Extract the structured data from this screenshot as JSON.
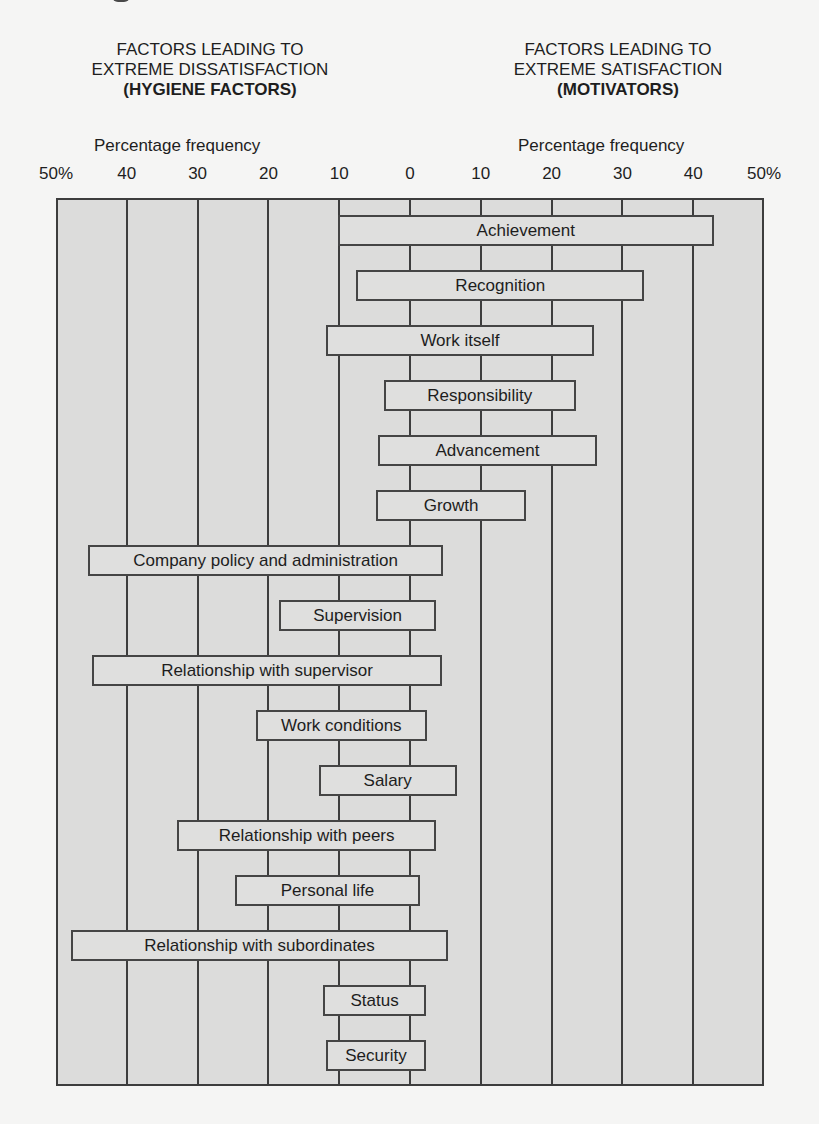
{
  "chart_data": {
    "type": "bar",
    "subtype": "diverging-horizontal-range",
    "left_heading": {
      "line1": "FACTORS LEADING TO",
      "line2": "EXTREME DISSATISFACTION",
      "line3": "(HYGIENE FACTORS)"
    },
    "right_heading": {
      "line1": "FACTORS LEADING TO",
      "line2": "EXTREME SATISFACTION",
      "line3": "(MOTIVATORS)"
    },
    "xlabel_left": "Percentage frequency",
    "xlabel_right": "Percentage frequency",
    "ticks": [
      {
        "value": -50,
        "label": "50%"
      },
      {
        "value": -40,
        "label": "40"
      },
      {
        "value": -30,
        "label": "30"
      },
      {
        "value": -20,
        "label": "20"
      },
      {
        "value": -10,
        "label": "10"
      },
      {
        "value": 0,
        "label": "0"
      },
      {
        "value": 10,
        "label": "10"
      },
      {
        "value": 20,
        "label": "20"
      },
      {
        "value": 30,
        "label": "30"
      },
      {
        "value": 40,
        "label": "40"
      },
      {
        "value": 50,
        "label": "50%"
      }
    ],
    "xlim": [
      -50,
      50
    ],
    "grid": true,
    "legend": "none",
    "note": "Bars span from dissatisfaction frequency (left of 0) to satisfaction frequency (right of 0). Values estimated from gridlines.",
    "categories": [
      "Achievement",
      "Recognition",
      "Work itself",
      "Responsibility",
      "Advancement",
      "Growth",
      "Company policy and administration",
      "Supervision",
      "Relationship with supervisor",
      "Work conditions",
      "Salary",
      "Relationship with peers",
      "Personal life",
      "Relationship with subordinates",
      "Status",
      "Security"
    ],
    "series": [
      {
        "name": "Dissatisfaction (left extent, %)",
        "values": [
          10,
          8,
          12,
          4,
          4.5,
          5,
          45.5,
          18.5,
          45,
          22,
          13,
          33,
          24.5,
          48,
          12,
          12
        ]
      },
      {
        "name": "Satisfaction (right extent, %)",
        "values": [
          43,
          33,
          26,
          23.5,
          26.5,
          16.5,
          4.5,
          3.5,
          4.5,
          2.5,
          6.5,
          3.5,
          1.5,
          5.5,
          2.5,
          2.5
        ]
      }
    ],
    "bars": [
      {
        "label": "Achievement",
        "left": -10.2,
        "right": 42.9,
        "group": "motivator"
      },
      {
        "label": "Recognition",
        "left": -7.6,
        "right": 33.1,
        "group": "motivator"
      },
      {
        "label": "Work itself",
        "left": -11.9,
        "right": 26.0,
        "group": "motivator"
      },
      {
        "label": "Responsibility",
        "left": -3.7,
        "right": 23.4,
        "group": "motivator"
      },
      {
        "label": "Advancement",
        "left": -4.5,
        "right": 26.4,
        "group": "motivator"
      },
      {
        "label": "Growth",
        "left": -4.8,
        "right": 16.4,
        "group": "motivator"
      },
      {
        "label": "Company policy and administration",
        "left": -45.5,
        "right": 4.7,
        "group": "hygiene"
      },
      {
        "label": "Supervision",
        "left": -18.5,
        "right": 3.7,
        "group": "hygiene"
      },
      {
        "label": "Relationship with supervisor",
        "left": -44.9,
        "right": 4.5,
        "group": "hygiene"
      },
      {
        "label": "Work conditions",
        "left": -21.8,
        "right": 2.4,
        "group": "hygiene"
      },
      {
        "label": "Salary",
        "left": -12.9,
        "right": 6.6,
        "group": "hygiene"
      },
      {
        "label": "Relationship with peers",
        "left": -32.9,
        "right": 3.7,
        "group": "hygiene"
      },
      {
        "label": "Personal life",
        "left": -24.7,
        "right": 1.4,
        "group": "hygiene"
      },
      {
        "label": "Relationship with subordinates",
        "left": -47.9,
        "right": 5.4,
        "group": "hygiene"
      },
      {
        "label": "Status",
        "left": -12.3,
        "right": 2.3,
        "group": "hygiene"
      },
      {
        "label": "Security",
        "left": -11.9,
        "right": 2.3,
        "group": "hygiene"
      }
    ]
  },
  "colors": {
    "page_background": "#f5f5f4",
    "plot_background": "#dcdcdb",
    "bar_fill": "#dfdfde",
    "line": "#3d3d3d",
    "text": "#1e1e1e"
  }
}
